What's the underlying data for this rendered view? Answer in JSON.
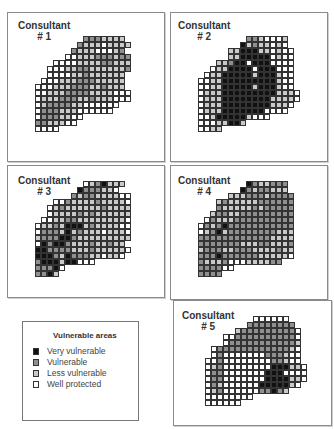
{
  "colors": {
    "0": null,
    "1": "#ffffff",
    "2": "#c9c9c9",
    "3": "#8f8f8f",
    "4": "#111111"
  },
  "legend": {
    "title": "Vulnerable areas",
    "items": [
      {
        "label": "Very vulnerable",
        "color": "#111111"
      },
      {
        "label": "Vulnerable",
        "color": "#8f8f8f"
      },
      {
        "label": "Less vulnerable",
        "color": "#c9c9c9"
      },
      {
        "label": "Well protected",
        "color": "#ffffff"
      }
    ]
  },
  "panels": [
    {
      "id": 1,
      "title": "Consultant",
      "number": "# 1",
      "frame": [
        7,
        12,
        156,
        148
      ],
      "title_pos": [
        18,
        20
      ],
      "grid_origin": [
        35,
        36
      ],
      "rows": [
        "00000000333222200",
        "00000003222122220",
        "00000032221112300",
        "00000112223332330",
        "00011112222332220",
        "00111223322222230",
        "00111122322222200",
        "01112223332222200",
        "11122233322322200",
        "11222333322221110",
        "12223332232221110",
        "12333322111111000",
        "13332221111110000",
        "13332211000000000",
        "33222110000000000",
        "11110000000000000"
      ]
    },
    {
      "id": 2,
      "title": "Consultant",
      "number": "# 2",
      "frame": [
        170,
        12,
        156,
        148
      ],
      "title_pos": [
        178,
        20
      ],
      "grid_origin": [
        198,
        36
      ],
      "rows": [
        "00000000332111200",
        "00000004232212100",
        "00000224442212110",
        "00000224444412110",
        "00022344144411110",
        "00122444414441110",
        "01224444424442110",
        "11224444444442110",
        "11224444424442110",
        "12224444444442221",
        "12224444444422221",
        "12224444444422210",
        "12224444444111100",
        "11244444211100000",
        "11122442000000000",
        "11220000000000000"
      ]
    },
    {
      "id": 3,
      "title": "Consultant",
      "number": "# 3",
      "frame": [
        7,
        165,
        156,
        131
      ],
      "title_pos": [
        18,
        175
      ],
      "grid_origin": [
        35,
        181
      ],
      "rows": [
        "00000000123422200",
        "00000004333221000",
        "00000032332222110",
        "00011322223222210",
        "00123222222322220",
        "00122223232222220",
        "01122332222222210",
        "12232444232222110",
        "13332423222122210",
        "23334432222222220",
        "14344322232232200",
        "44333322232222210",
        "44432433322122100",
        "34442441110000000",
        "33341000000000000",
        "3342000000000000"
      ]
    },
    {
      "id": 4,
      "title": "Consultant",
      "number": "# 4",
      "frame": [
        170,
        165,
        156,
        133
      ],
      "title_pos": [
        178,
        175
      ],
      "grid_origin": [
        198,
        181
      ],
      "rows": [
        "00000000432233300",
        "00000004323322200",
        "00000222333233330",
        "00023222223333330",
        "00032222232333330",
        "00233223333333330",
        "01322233333333330",
        "13234333333333330",
        "12342333333332220",
        "33333333333322220",
        "33333332223322230",
        "23332233322223220",
        "33343333332222210",
        "32223111222233000",
        "33331100000000000",
        "3333000000000000"
      ]
    },
    {
      "id": 5,
      "title": "Consultant",
      "number": "# 5",
      "frame": [
        173,
        300,
        157,
        124
      ],
      "title_pos": [
        182,
        310
      ],
      "grid_origin": [
        205,
        316
      ],
      "rows": [
        "00000000111111000",
        "00000003333333300",
        "00000233333333310",
        "00011333333333310",
        "00013333333333320",
        "01333333333333210",
        "01311111113332110",
        "11311111111332110",
        "12311111111444221",
        "13311111114441111",
        "13311111114444221",
        "13211111144444210",
        "12311111133432000",
        "11111111000000000",
        "1111110000000000"
      ]
    }
  ]
}
